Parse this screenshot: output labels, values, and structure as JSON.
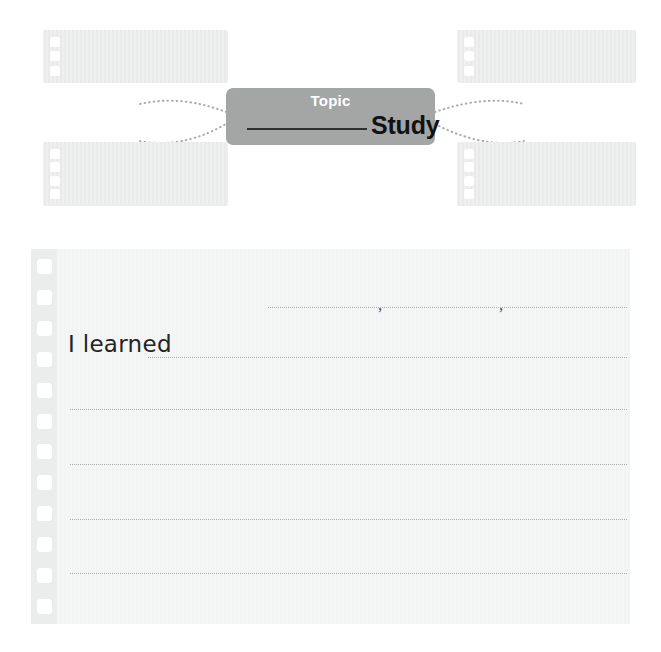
{
  "worksheet": {
    "organizer": {
      "center_card": {
        "label": "Topic",
        "blank_line": "",
        "study_text": "Study",
        "bg_color": "#a4a5a5",
        "label_color": "#ffffff",
        "study_color": "#111214"
      },
      "note_boxes": [
        {
          "id": "top-left",
          "holes": 3,
          "label": ""
        },
        {
          "id": "top-right",
          "holes": 3,
          "label": ""
        },
        {
          "id": "bottom-left",
          "holes": 4,
          "label": ""
        },
        {
          "id": "bottom-right",
          "holes": 4,
          "label": ""
        }
      ],
      "connector_style": "dotted",
      "connector_color": "#a9aaac",
      "connector_count": 4
    },
    "notebook": {
      "prompt": "I learned",
      "paper_color": "#f2f3f3",
      "hole_count": 12,
      "rule_line_color": "#b9babb",
      "rule_line_count": 6,
      "punctuation_marks": [
        ",",
        ","
      ],
      "lines": [
        {
          "id": "line-1",
          "text": ""
        },
        {
          "id": "line-2",
          "text": ""
        },
        {
          "id": "line-3",
          "text": ""
        },
        {
          "id": "line-4",
          "text": ""
        },
        {
          "id": "line-5",
          "text": ""
        },
        {
          "id": "line-6",
          "text": ""
        }
      ]
    }
  }
}
